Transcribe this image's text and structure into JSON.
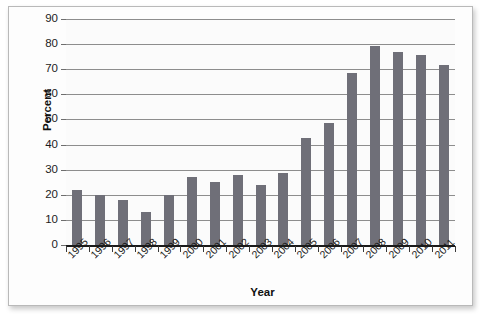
{
  "chart_data": {
    "type": "bar",
    "title": "",
    "xlabel": "Year",
    "ylabel": "Percent",
    "categories": [
      "1995",
      "1996",
      "1997",
      "1998",
      "1999",
      "2000",
      "2001",
      "2002",
      "2003",
      "2004",
      "2005",
      "2006",
      "2007",
      "2008",
      "2009",
      "2010",
      "2011"
    ],
    "values": [
      22,
      20,
      18,
      13,
      20,
      27,
      25,
      28,
      24,
      28.5,
      42.5,
      48.5,
      68.5,
      79.2,
      77,
      75.5,
      71.5
    ],
    "ylim": [
      0,
      90
    ],
    "ytick_labels": [
      "90",
      "80",
      "70",
      "60",
      "50",
      "40",
      "30",
      "20",
      "10",
      "0"
    ],
    "ytick_values": [
      90,
      80,
      70,
      60,
      50,
      40,
      30,
      20,
      10,
      0
    ],
    "ytick_step": 10,
    "grid": true,
    "legend": false,
    "legend_position": "none",
    "bar_color": "#6f6f78",
    "gridline_color": "#8d8d8d",
    "axis_color": "#1a1a1a",
    "plot_background": "#fbfbfb",
    "xlabel_rotation_degrees": -45
  }
}
